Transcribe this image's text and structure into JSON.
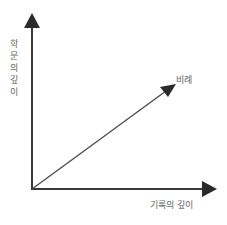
{
  "diagram": {
    "y_axis_label": [
      "학",
      "문",
      "의",
      "깊",
      "이"
    ],
    "x_axis_label": "기록의 깊이",
    "diagonal_label": "비례",
    "line_color": "#3a3a3a",
    "label_color": "#666666"
  }
}
